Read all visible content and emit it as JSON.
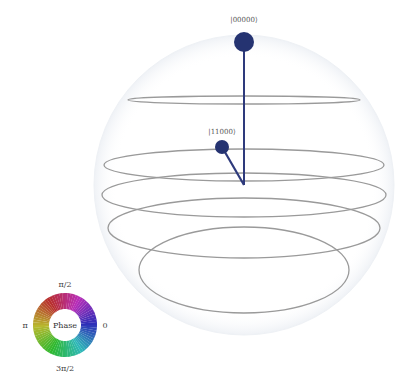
{
  "qsphere": {
    "center": {
      "x": 244,
      "y": 185
    },
    "sphere_radius": 150,
    "line_color": "#2e3a7c",
    "dot_color": "#253371",
    "ring_color": "#9a9a9a",
    "rings": [
      {
        "cy": 100,
        "rx": 116,
        "ry": 4
      },
      {
        "cy": 165,
        "rx": 140,
        "ry": 16
      },
      {
        "cy": 195,
        "rx": 142,
        "ry": 22
      },
      {
        "cy": 228,
        "rx": 136,
        "ry": 30
      },
      {
        "cy": 270,
        "rx": 105,
        "ry": 43
      }
    ],
    "states": [
      {
        "label": "|00000⟩",
        "x": 244,
        "y": 42,
        "r": 10,
        "label_y": 22
      },
      {
        "label": "|11000⟩",
        "x": 222,
        "y": 147,
        "r": 7,
        "label_y": 134
      }
    ]
  },
  "phase_wheel": {
    "center_label": "Phase",
    "top_label": "π/2",
    "left_label": "π",
    "right_label": "0",
    "bottom_label": "3π/2"
  }
}
